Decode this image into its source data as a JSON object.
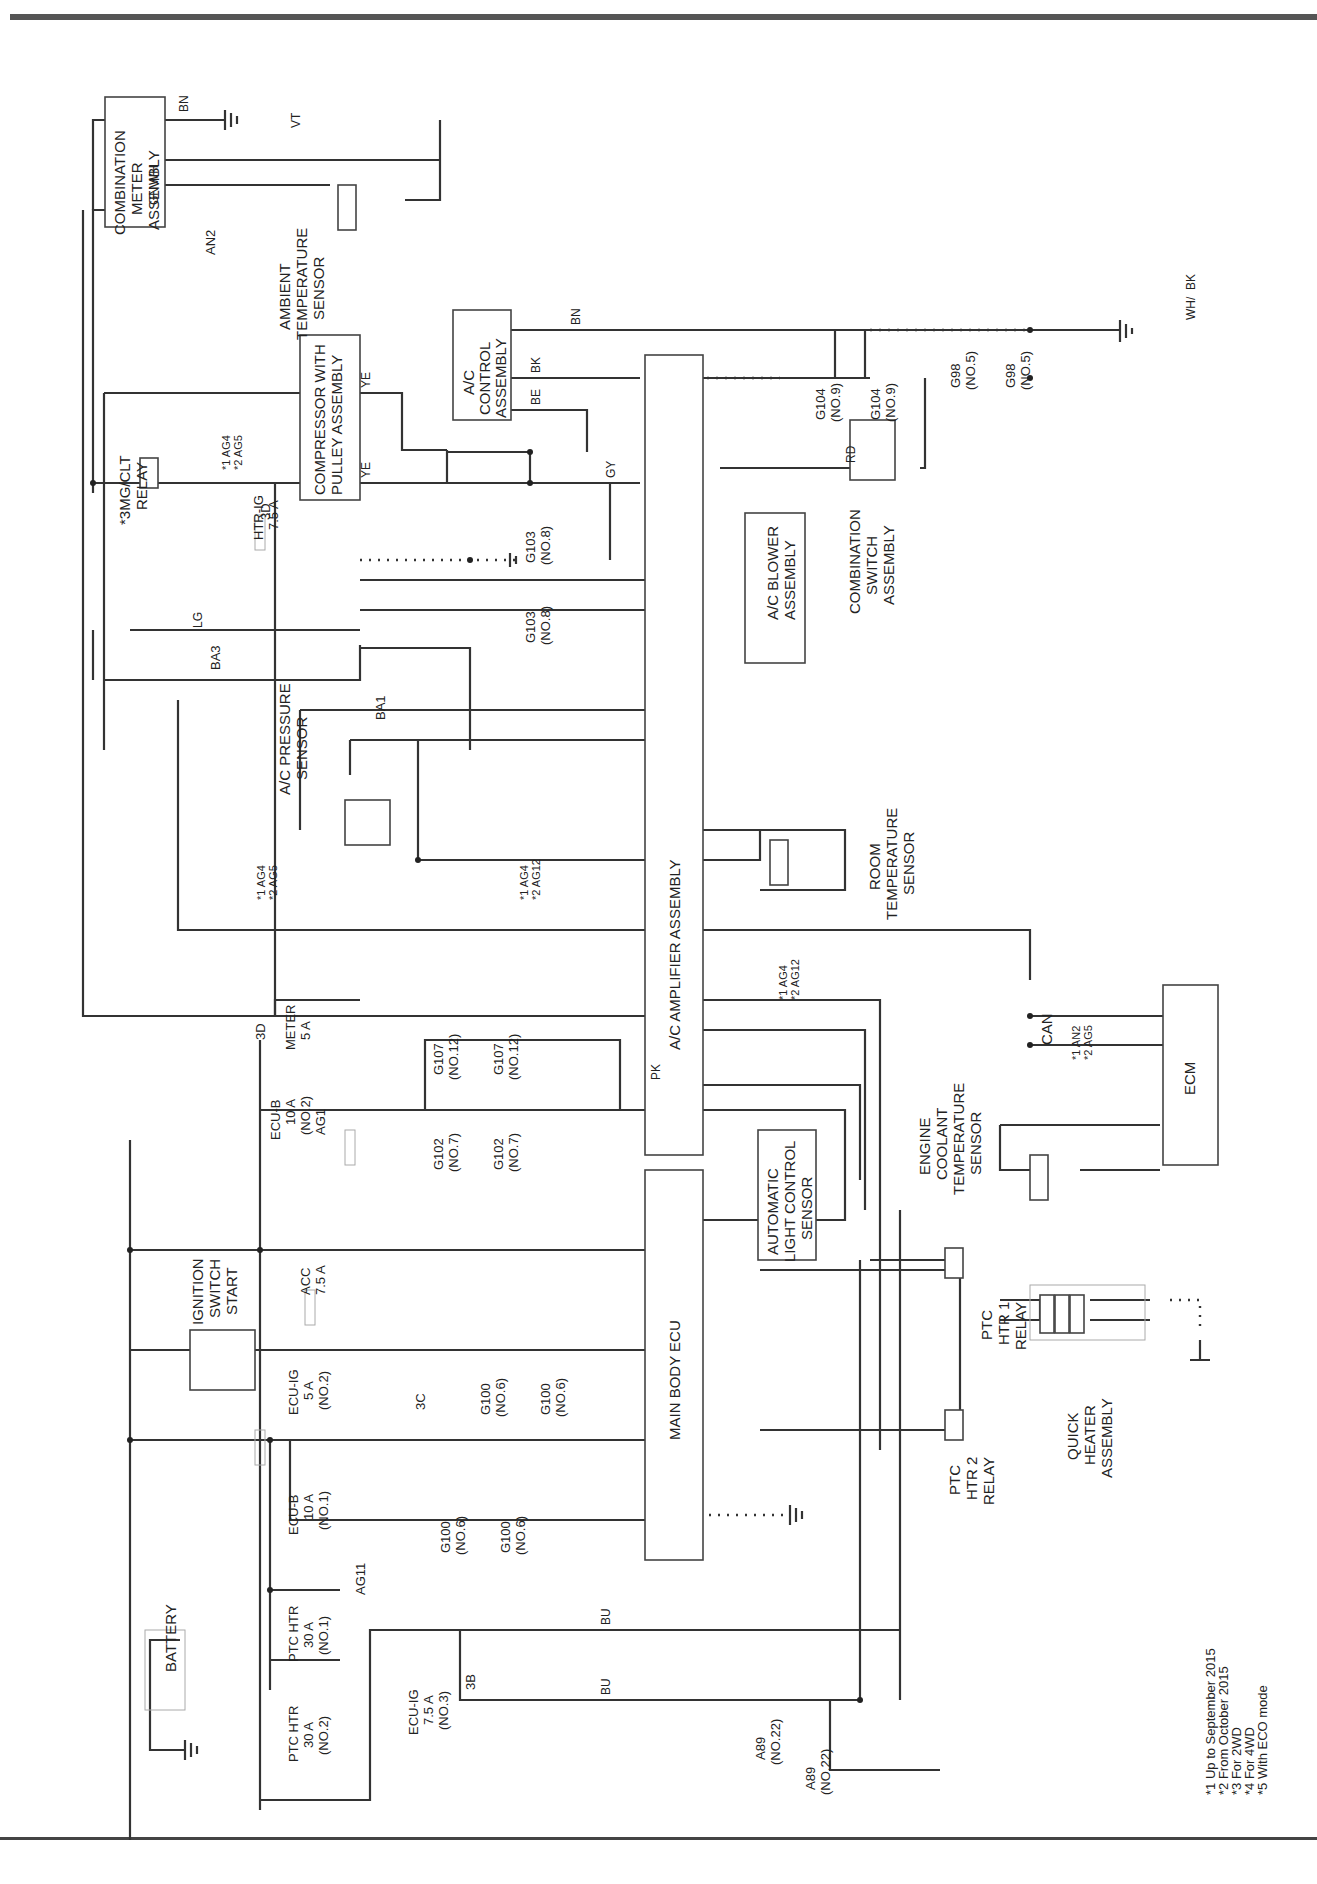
{
  "components": {
    "combination_meter": [
      "COMBINATION",
      "METER",
      "ASSEMBLY"
    ],
    "ambient_sensor": [
      "AMBIENT",
      "TEMPERATURE",
      "SENSOR"
    ],
    "ac_control": [
      "A/C",
      "CONTROL",
      "ASSEMBLY"
    ],
    "compressor": [
      "COMPRESSOR WITH",
      "PULLEY ASSEMBLY"
    ],
    "mgclt_relay": [
      "*3MG/CLT",
      "RELAY"
    ],
    "ac_pressure": [
      "A/C PRESSURE",
      "SENSOR"
    ],
    "ac_amplifier": "A/C AMPLIFIER ASSEMBLY",
    "ac_blower": [
      "A/C BLOWER",
      "ASSEMBLY"
    ],
    "combination_switch": [
      "COMBINATION",
      "SWITCH",
      "ASSEMBLY"
    ],
    "room_sensor": [
      "ROOM",
      "TEMPERATURE",
      "SENSOR"
    ],
    "ecm": "ECM",
    "engine_coolant": [
      "ENGINE",
      "COOLANT",
      "TEMPERATURE",
      "SENSOR"
    ],
    "can": "CAN",
    "main_body_ecu": "MAIN BODY ECU",
    "auto_light": [
      "AUTOMATIC",
      "LIGHT CONTROL",
      "SENSOR"
    ],
    "ignition": [
      "IGNITION",
      "SWITCH",
      "START"
    ],
    "battery": "BATTERY",
    "ptc1_relay": [
      "PTC",
      "HTR 1",
      "RELAY"
    ],
    "ptc2_relay": [
      "PTC",
      "HTR 2",
      "RELAY"
    ],
    "quick_heater": [
      "QUICK",
      "HEATER",
      "ASSEMBLY"
    ]
  },
  "fuses": {
    "htr_ig": [
      "HTR-IG",
      "7.5 A"
    ],
    "meter": [
      "METER",
      "5 A"
    ],
    "ecu_b2": [
      "ECU-B",
      "10 A",
      "(NO.2)"
    ],
    "acc": [
      "ACC",
      "7.5 A"
    ],
    "ecu_ig2": [
      "ECU-IG",
      "5 A",
      "(NO.2)"
    ],
    "ecu_b1": [
      "ECU-B",
      "10 A",
      "(NO.1)"
    ],
    "ptc1": [
      "PTC HTR",
      "30 A",
      "(NO.1)"
    ],
    "ptc2": [
      "PTC HTR",
      "30 A",
      "(NO.2)"
    ],
    "ecu_ig3": [
      "ECU-IG",
      "7.5 A",
      "(NO.3)"
    ]
  },
  "junctions": {
    "g103": [
      "G103",
      "(NO.8)"
    ],
    "g104": [
      "G104",
      "(NO.9)"
    ],
    "g98": [
      "G98",
      "(NO.5)"
    ],
    "g107": [
      "G107",
      "(NO.12)"
    ],
    "g102": [
      "G102",
      "(NO.7)"
    ],
    "g100": [
      "G100",
      "(NO.6)"
    ],
    "a89": [
      "A89",
      "(NO.22)"
    ]
  },
  "connectors": {
    "an2": "AN2",
    "ba3": "BA3",
    "ba1": "BA1",
    "ag1": "AG1",
    "ag11": "AG11",
    "c3d": "3D",
    "c3c": "3C",
    "c3b": "3B",
    "ag4_ag5": [
      "*1 AG4",
      "*2 AG5"
    ],
    "ag4_ag12": [
      "*1 AG4",
      "*2 AG12"
    ],
    "an2_ag5": [
      "*1 AN2",
      "*2 AG5"
    ]
  },
  "wire_colors": {
    "bn": "BN",
    "gn": "GN",
    "wh": "WH",
    "vt": "VT",
    "bk": "BK",
    "ye": "YE",
    "be": "BE",
    "gy": "GY",
    "rd": "RD",
    "lg": "LG",
    "pk": "PK",
    "bu": "BU",
    "whbk": [
      "WH",
      "/",
      "BK"
    ]
  },
  "notes": [
    "*1 Up to September 2015",
    "*2 From October 2015",
    "*3 For 2WD",
    "*4 For 4WD",
    "*5 With ECO mode"
  ]
}
